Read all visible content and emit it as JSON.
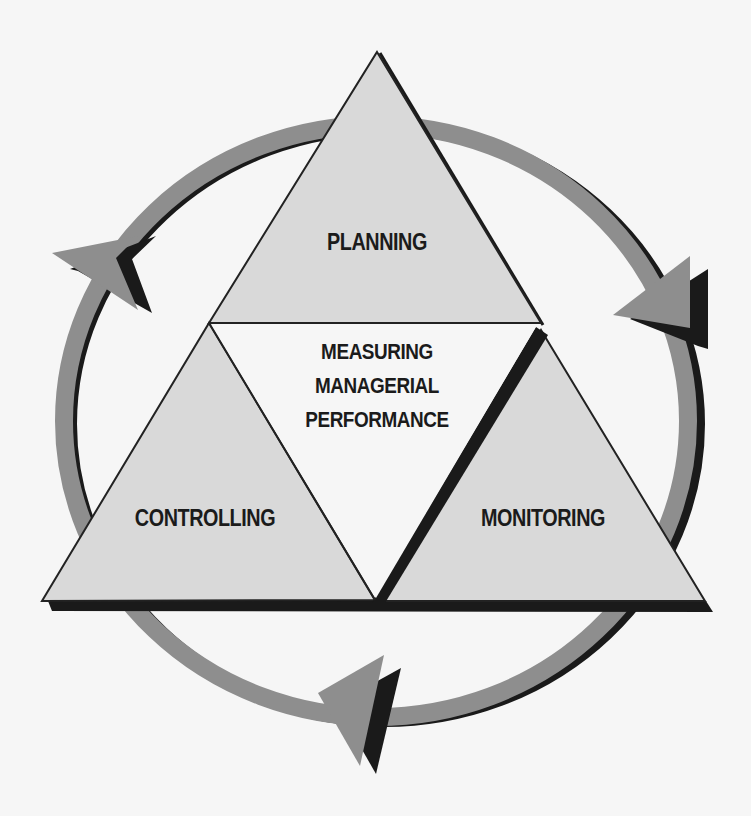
{
  "diagram": {
    "center_label": [
      "MEASURING",
      "MANAGERIAL",
      "PERFORMANCE"
    ],
    "nodes": [
      {
        "id": "planning",
        "label": "PLANNING",
        "position": "top"
      },
      {
        "id": "monitoring",
        "label": "MONITORING",
        "position": "bottom-right"
      },
      {
        "id": "controlling",
        "label": "CONTROLLING",
        "position": "bottom-left"
      }
    ],
    "flow": {
      "direction": "clockwise",
      "arrows": [
        {
          "from": "planning",
          "to": "monitoring",
          "position": "right"
        },
        {
          "from": "monitoring",
          "to": "controlling",
          "position": "bottom"
        },
        {
          "from": "controlling",
          "to": "planning",
          "position": "left"
        }
      ]
    },
    "colors": {
      "background": "#f6f6f6",
      "triangle_fill": "#d9d9d9",
      "ring_fill": "#8e8e8e",
      "shadow": "#1a1a1a",
      "outline": "#222222",
      "text": "#1b1b1b"
    }
  }
}
